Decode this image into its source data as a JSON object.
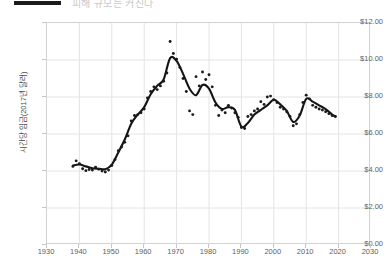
{
  "header": {
    "bar_label": "",
    "clipped_text": "피해 규모는 커진다"
  },
  "chart_data": {
    "type": "scatter",
    "title": "",
    "xlabel": "",
    "ylabel": "시간당 임금(2017년 달러)",
    "xlim": [
      1930,
      2030
    ],
    "ylim": [
      0,
      12
    ],
    "grid": true,
    "legend": "none",
    "xticks": [
      1930,
      1940,
      1950,
      1960,
      1970,
      1980,
      1990,
      2000,
      2010,
      2020,
      2030
    ],
    "xtick_labels": [
      "1930",
      "1940",
      "1950",
      "1960",
      "1970",
      "1980",
      "1990",
      "2000",
      "2010",
      "2020",
      "2030"
    ],
    "yticks": [
      0,
      2,
      4,
      6,
      8,
      10,
      12
    ],
    "ytick_labels": [
      "$0.00",
      "$2.00",
      "$4.00",
      "$6.00",
      "$8.00",
      "$10.00",
      "$12.00"
    ],
    "series": [
      {
        "name": "관측값",
        "type": "scatter",
        "x": [
          1938,
          1939,
          1940,
          1941,
          1942,
          1943,
          1944,
          1945,
          1946,
          1947,
          1948,
          1949,
          1950,
          1951,
          1952,
          1953,
          1954,
          1955,
          1956,
          1957,
          1958,
          1959,
          1960,
          1961,
          1962,
          1963,
          1964,
          1965,
          1966,
          1967,
          1968,
          1969,
          1970,
          1971,
          1972,
          1973,
          1974,
          1975,
          1976,
          1977,
          1978,
          1979,
          1980,
          1981,
          1982,
          1983,
          1984,
          1985,
          1986,
          1987,
          1988,
          1989,
          1990,
          1991,
          1992,
          1993,
          1994,
          1995,
          1996,
          1997,
          1998,
          1999,
          2000,
          2001,
          2002,
          2003,
          2004,
          2005,
          2006,
          2007,
          2008,
          2009,
          2010,
          2011,
          2012,
          2013,
          2014,
          2015,
          2016,
          2017,
          2018,
          2019
        ],
        "y": [
          4.25,
          4.55,
          4.4,
          4.12,
          4.02,
          4.08,
          4.05,
          4.2,
          4.1,
          4.0,
          3.95,
          4.05,
          4.3,
          4.62,
          5.1,
          5.3,
          5.55,
          5.9,
          6.7,
          7.0,
          7.05,
          7.15,
          7.35,
          7.95,
          8.3,
          8.55,
          8.4,
          8.6,
          8.85,
          9.3,
          11.0,
          10.35,
          10.05,
          9.6,
          9.0,
          8.3,
          7.25,
          7.05,
          9.1,
          8.6,
          9.35,
          8.95,
          9.2,
          8.55,
          7.55,
          7.0,
          7.3,
          7.15,
          7.55,
          7.4,
          7.15,
          6.9,
          6.35,
          6.3,
          6.95,
          7.05,
          7.25,
          7.35,
          7.75,
          7.6,
          8.0,
          8.05,
          7.85,
          7.7,
          7.45,
          7.35,
          7.2,
          6.95,
          6.45,
          6.55,
          7.05,
          7.7,
          8.1,
          7.9,
          7.55,
          7.45,
          7.35,
          7.3,
          7.2,
          7.1,
          7.0,
          6.95
        ]
      },
      {
        "name": "추세선",
        "type": "line",
        "x": [
          1938,
          1940,
          1942,
          1944,
          1946,
          1948,
          1950,
          1952,
          1954,
          1956,
          1958,
          1960,
          1962,
          1964,
          1966,
          1968,
          1970,
          1972,
          1974,
          1976,
          1978,
          1980,
          1982,
          1984,
          1986,
          1988,
          1990,
          1992,
          1994,
          1996,
          1998,
          2000,
          2002,
          2004,
          2006,
          2008,
          2010,
          2012,
          2014,
          2016,
          2018,
          2019
        ],
        "y": [
          4.3,
          4.35,
          4.25,
          4.15,
          4.12,
          4.1,
          4.35,
          5.0,
          5.7,
          6.55,
          7.05,
          7.45,
          8.15,
          8.6,
          8.95,
          10.1,
          9.95,
          9.25,
          8.45,
          8.1,
          8.65,
          8.45,
          7.7,
          7.35,
          7.45,
          7.3,
          6.4,
          6.6,
          7.05,
          7.3,
          7.55,
          7.85,
          7.6,
          7.25,
          6.65,
          7.0,
          7.9,
          7.75,
          7.55,
          7.35,
          7.05,
          6.95
        ]
      }
    ]
  }
}
